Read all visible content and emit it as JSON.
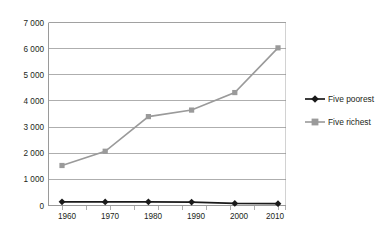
{
  "chart_data": {
    "type": "line",
    "title": "",
    "subtitle": "",
    "xlabel": "",
    "ylabel": "",
    "categories": [
      "1960",
      "1970",
      "1980",
      "1990",
      "2000",
      "2010"
    ],
    "x": [
      1960,
      1970,
      1980,
      1990,
      2000,
      2010
    ],
    "xlim": [
      1960,
      2010
    ],
    "ylim": [
      0,
      7000
    ],
    "ytick_values": [
      0,
      1000,
      2000,
      3000,
      4000,
      5000,
      6000,
      7000
    ],
    "ytick_labels": [
      "0",
      "1 000",
      "2 000",
      "3 000",
      "4 000",
      "5 000",
      "6 000",
      "7 000"
    ],
    "xtick_labels": [
      "1960",
      "1970",
      "1980",
      "1990",
      "2000",
      "2010"
    ],
    "grid": "horizontal",
    "legend_position": "right",
    "series": [
      {
        "name": "Five poorest",
        "values": [
          140,
          135,
          140,
          130,
          80,
          70
        ],
        "color": "#1a1a1a",
        "marker": "diamond"
      },
      {
        "name": "Five richest",
        "values": [
          1530,
          2075,
          3400,
          3650,
          4320,
          6030
        ],
        "color": "#9a9a9a",
        "marker": "square"
      }
    ]
  },
  "legend": {
    "items": [
      {
        "label": "Five poorest",
        "marker": "diamond-marker",
        "color": "#1a1a1a"
      },
      {
        "label": "Five richest",
        "marker": "square-marker",
        "color": "#9a9a9a"
      }
    ]
  },
  "axes": {
    "y_labels": [
      "7 000",
      "6 000",
      "5 000",
      "4 000",
      "3 000",
      "2 000",
      "1 000",
      "0"
    ],
    "x_labels": [
      "1960",
      "1970",
      "1980",
      "1990",
      "2000",
      "2010"
    ]
  },
  "colors": {
    "background": "#ffffff",
    "gridline": "#8c8c8c",
    "series_poorest": "#1a1a1a",
    "series_richest": "#9a9a9a",
    "text": "#231f20"
  }
}
